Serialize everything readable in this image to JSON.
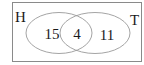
{
  "diagram": {
    "type": "venn",
    "sets": [
      {
        "name": "H",
        "only_count": "15"
      },
      {
        "name": "T",
        "only_count": "11"
      }
    ],
    "intersection": "4",
    "labels": {
      "set_a": "H",
      "set_b": "T",
      "a_only": "15",
      "both": "4",
      "b_only": "11"
    },
    "colors": {
      "border": "#8a8a8a",
      "ellipse": "#9a9a9a",
      "text": "#1a1a1a",
      "background": "#ffffff"
    }
  }
}
